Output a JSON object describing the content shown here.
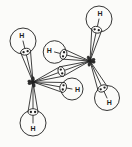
{
  "figure": {
    "kind": "orbital-overlap-diagram",
    "background": "#fbfbf9",
    "ink": "#1f1f1f",
    "knot_fill": "#2e2e2e",
    "canvas": {
      "width": 132,
      "height": 147
    },
    "carbons": [
      {
        "id": "C-left",
        "x": 33,
        "y": 82
      },
      {
        "id": "C-right",
        "x": 90,
        "y": 61
      }
    ],
    "cc_bond": {
      "from": "C-left",
      "to": "C-right",
      "electron_dots": 2
    },
    "hydrogens": [
      {
        "id": "H-upper-left",
        "label": "H",
        "x": 23,
        "y": 41,
        "r": 13,
        "bond": "C-left",
        "electron_dots": 2
      },
      {
        "id": "H-lower-left",
        "label": "H",
        "x": 33,
        "y": 123,
        "r": 13,
        "bond": "C-left",
        "electron_dots": 2
      },
      {
        "id": "H-inner-lower",
        "label": "H",
        "x": 72,
        "y": 89,
        "r": 11,
        "bond": "C-left",
        "electron_dots": 2
      },
      {
        "id": "H-upper-right",
        "label": "H",
        "x": 99,
        "y": 19,
        "r": 13,
        "bond": "C-right",
        "electron_dots": 2
      },
      {
        "id": "H-lower-right",
        "label": "H",
        "x": 107,
        "y": 98,
        "r": 12.5,
        "bond": "C-right",
        "electron_dots": 2
      },
      {
        "id": "H-inner-upper",
        "label": "H",
        "x": 54.5,
        "y": 52,
        "r": 11.3,
        "bond": "C-right",
        "electron_dots": 2
      }
    ],
    "lobe": {
      "ellipse_rx": 5,
      "ellipse_ry": 3.3,
      "dot_radius": 1.15,
      "dot_offset": 2.1
    }
  }
}
